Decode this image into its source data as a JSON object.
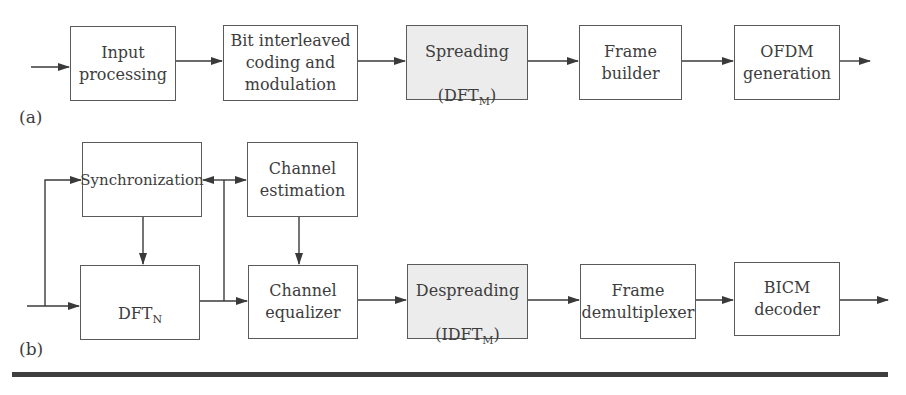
{
  "diagram": {
    "panel_a": {
      "label": "(a)",
      "blocks": [
        {
          "id": "input-processing",
          "text": "Input\nprocessing",
          "shaded": false
        },
        {
          "id": "bit-interleaved-coding",
          "text": "Bit interleaved\ncoding and\nmodulation",
          "shaded": false
        },
        {
          "id": "spreading",
          "text": "Spreading",
          "sub_prefix": "(DFT",
          "sub": "M",
          "sub_suffix": ")",
          "shaded": true
        },
        {
          "id": "frame-builder",
          "text": "Frame\nbuilder",
          "shaded": false
        },
        {
          "id": "ofdm-generation",
          "text": "OFDM\ngeneration",
          "shaded": false
        }
      ]
    },
    "panel_b": {
      "label": "(b)",
      "blocks": [
        {
          "id": "synchronization",
          "text": "Synchronization",
          "shaded": false
        },
        {
          "id": "channel-estimation",
          "text": "Channel\nestimation",
          "shaded": false
        },
        {
          "id": "dft-n",
          "text": "DFT",
          "sub": "N",
          "shaded": false
        },
        {
          "id": "channel-equalizer",
          "text": "Channel\nequalizer",
          "shaded": false
        },
        {
          "id": "despreading",
          "text": "Despreading",
          "sub_prefix": "(IDFT",
          "sub": "M",
          "sub_suffix": ")",
          "shaded": true
        },
        {
          "id": "frame-demultiplexer",
          "text": "Frame\ndemultiplexer",
          "shaded": false
        },
        {
          "id": "bicm-decoder",
          "text": "BICM\ndecoder",
          "shaded": false
        }
      ]
    },
    "colors": {
      "line": "#3a3a3a",
      "shaded_fill": "#ececec",
      "box_border": "#5a5a5a"
    }
  }
}
